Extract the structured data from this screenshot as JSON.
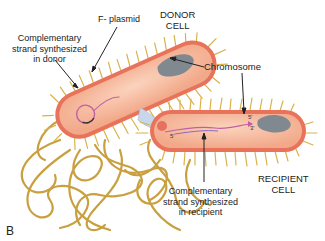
{
  "figure": {
    "panel_label": "B"
  },
  "labels": {
    "f_plasmid": "F- plasmid",
    "donor_cell_line1": "DONOR",
    "donor_cell_line2": "CELL",
    "comp_donor_line1": "Complementary",
    "comp_donor_line2": "strand synthesized",
    "comp_donor_line3": "in donor",
    "chromosome": "Chromosome",
    "recipient_cell_line1": "RECIPIENT",
    "recipient_cell_line2": "CELL",
    "comp_recipient_line1": "Complementary",
    "comp_recipient_line2": "strand synthesized",
    "comp_recipient_line3": "in recipient",
    "strand_5prime_a": "5'",
    "strand_5prime_b": "5'",
    "strand_3prime": "3'"
  },
  "colors": {
    "cell_body": "#f4b89a",
    "cell_membrane": "#e8735a",
    "pili": "#d9b24a",
    "flagella": "#c9a040",
    "chromosome": "#808890",
    "plasmid": "#c060a0",
    "strand": "#9b59b6",
    "bridge": "#c8d8ec"
  }
}
